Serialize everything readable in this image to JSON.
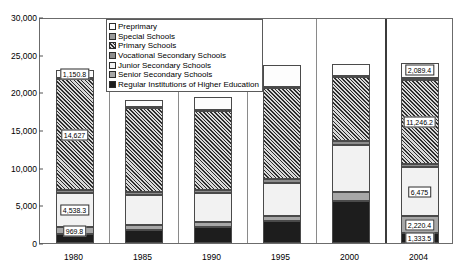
{
  "chart_data": {
    "type": "bar",
    "subtype": "stacked-column",
    "title": "",
    "xlabel": "",
    "ylabel": "",
    "ylim": [
      0,
      30000
    ],
    "ytick_labels": [
      "0",
      "5,000",
      "10,000",
      "15,000",
      "20,000",
      "25,000",
      "30,000"
    ],
    "ytick_values": [
      0,
      5000,
      10000,
      15000,
      20000,
      25000,
      30000
    ],
    "grid": false,
    "legend_position": "top-center",
    "categories": [
      "1980",
      "1985",
      "1990",
      "1995",
      "2000",
      "2004"
    ],
    "series": [
      {
        "name": "Regular Institutions of Higher Education",
        "fill": "higher",
        "values": [
          1144,
          1703,
          2063,
          2906,
          5561,
          1333.5
        ]
      },
      {
        "name": "Senior Secondary Schools",
        "fill": "senior",
        "values": [
          969.8,
          741,
          717,
          713,
          1201,
          2220.4
        ]
      },
      {
        "name": "Junior Secondary Schools",
        "fill": "junior",
        "values": [
          4538.3,
          3963,
          3918,
          4400,
          6253,
          6475
        ]
      },
      {
        "name": "Vocational Secondary Schools",
        "fill": "vocational",
        "values": [
          432,
          388,
          372,
          420,
          576,
          412
        ]
      },
      {
        "name": "Primary Schools",
        "fill": "primary",
        "values": [
          14627,
          11100,
          10490,
          12100,
          8400,
          11246.2
        ]
      },
      {
        "name": "Special Schools",
        "fill": "special",
        "values": [
          130,
          130,
          130,
          150,
          170,
          170
        ]
      },
      {
        "name": "Preprimary",
        "fill": "preprimary",
        "values": [
          1150.8,
          1000,
          1760,
          2890,
          1580,
          2089.4
        ]
      }
    ],
    "totals": [
      22992,
      19025,
      19450,
      23579,
      23741,
      23946.5
    ],
    "value_labels": [
      {
        "category": "1980",
        "series": "Preprimary",
        "text": "1,150.8"
      },
      {
        "category": "1980",
        "series": "Primary Schools",
        "text": "14,627"
      },
      {
        "category": "1980",
        "series": "Junior Secondary Schools",
        "text": "4,538.3"
      },
      {
        "category": "1980",
        "series": "Senior Secondary Schools",
        "text": "969.8"
      },
      {
        "category": "2004",
        "series": "Preprimary",
        "text": "2,089.4"
      },
      {
        "category": "2004",
        "series": "Primary Schools",
        "text": "11,246.2"
      },
      {
        "category": "2004",
        "series": "Junior Secondary Schools",
        "text": "6,475"
      },
      {
        "category": "2004",
        "series": "Senior Secondary Schools",
        "text": "2,220.4"
      },
      {
        "category": "2004",
        "series": "Regular Institutions of Higher Education",
        "text": "1,333.5"
      }
    ],
    "legend": [
      {
        "label": "Preprimary",
        "fill": "preprimary"
      },
      {
        "label": "Special Schools",
        "fill": "special"
      },
      {
        "label": "Primary Schools",
        "fill": "primary"
      },
      {
        "label": "Vocational Secondary Schools",
        "fill": "vocational"
      },
      {
        "label": "Junior Secondary Schools",
        "fill": "junior"
      },
      {
        "label": "Senior Secondary Schools",
        "fill": "senior"
      },
      {
        "label": "Regular Institutions of Higher Education",
        "fill": "higher"
      }
    ],
    "colors": {
      "preprimary": "#fdfdfd",
      "special": "#9a9a9a",
      "primary": "#6f6f6f",
      "vocational": "#8d8d8d",
      "junior": "#f2f2f2",
      "senior": "#a7a7a7",
      "higher": "#1d1d1d",
      "frame": "#6b6b6b",
      "separator": "#8a8a8a"
    }
  }
}
